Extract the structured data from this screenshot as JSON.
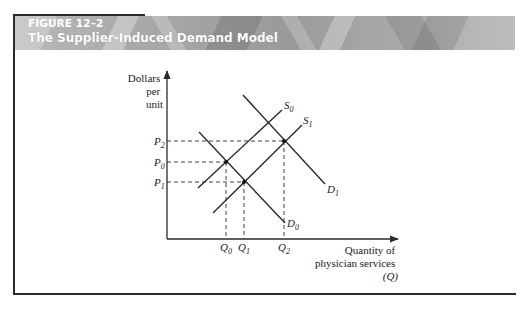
{
  "figure": {
    "number": "FIGURE 12–2",
    "title": "The Supplier-Induced Demand Model"
  },
  "axes": {
    "y_label_lines": [
      "Dollars",
      "per",
      "unit"
    ],
    "x_label_lines": [
      "Quantity of",
      "physician services",
      "(Q)"
    ]
  },
  "curves": {
    "S0": {
      "label": "S",
      "sub": "0"
    },
    "S1": {
      "label": "S",
      "sub": "1"
    },
    "D0": {
      "label": "D",
      "sub": "0"
    },
    "D1": {
      "label": "D",
      "sub": "1"
    }
  },
  "price_ticks": [
    {
      "label": "P",
      "sub": "2"
    },
    {
      "label": "P",
      "sub": "0"
    },
    {
      "label": "P",
      "sub": "1"
    }
  ],
  "quantity_ticks": [
    {
      "label": "Q",
      "sub": "0"
    },
    {
      "label": "Q",
      "sub": "1"
    },
    {
      "label": "Q",
      "sub": "2"
    }
  ],
  "colors": {
    "line": "#2a2a2a",
    "header_band": "#a8a8a8",
    "header_text": "#ffffff"
  }
}
